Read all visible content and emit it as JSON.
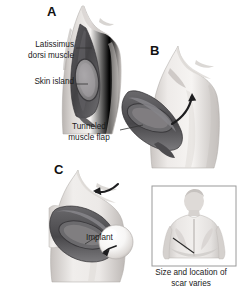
{
  "figure": {
    "background_color": "#ffffff",
    "text_color": "#1a1a1a",
    "skin_tone_light": "#f2f0ee",
    "skin_tone_mid": "#d8d4d1",
    "skin_tone_shadow": "#b4afac",
    "muscle_dark": "#4a4a4c",
    "muscle_mid": "#6f6e71",
    "skin_island_fill": "#8c8a8c",
    "implant_fill": "#ffffff",
    "leader_line_color": "#333333",
    "inset_border_color": "#9a9a9a"
  },
  "panels": [
    {
      "id": "A",
      "letter": "A",
      "caption": ""
    },
    {
      "id": "B",
      "letter": "B",
      "caption": ""
    },
    {
      "id": "C",
      "letter": "C",
      "caption": ""
    }
  ],
  "labels": {
    "latissimus": "Latissimus\ndorsi muscle",
    "latissimus_line1": "Latissimus",
    "latissimus_line2": "dorsi muscle",
    "skin_island": "Skin island",
    "tunneled_line1": "Tunneled",
    "tunneled_line2": "muscle flap",
    "implant": "Implant",
    "scar_line1": "Size and location of",
    "scar_line2": "scar varies"
  },
  "inset": {
    "name": "back-view-inset",
    "content": "posterior torso showing diagonal donor-site scar"
  },
  "icons": {
    "arrow_b": "curved-arrow-icon",
    "arrow_c": "curved-arrow-icon"
  }
}
